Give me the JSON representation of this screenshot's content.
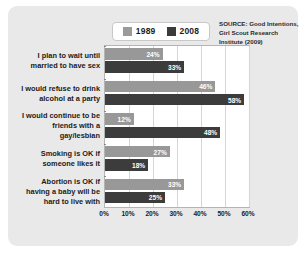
{
  "legend": {
    "entries": [
      {
        "label": "1989",
        "color": "#989898"
      },
      {
        "label": "2008",
        "color": "#3c3c3c"
      }
    ]
  },
  "source": {
    "line1": "SOURCE: Good Intentions,",
    "line2": "Girl Scout Research",
    "line3": "Institute (2009)"
  },
  "chart_data": {
    "type": "bar",
    "orientation": "horizontal",
    "title": "",
    "subtitle": "",
    "xlabel": "",
    "ylabel": "",
    "xlim": [
      0,
      60
    ],
    "grid": true,
    "legend_position": "top",
    "tick_labels": [
      "0%",
      "10%",
      "20%",
      "30%",
      "40%",
      "50%",
      "60%"
    ],
    "tick_values": [
      0,
      10,
      20,
      30,
      40,
      50,
      60
    ],
    "categories": [
      "I plan to wait until married to have sex",
      "I would refuse to drink alcohol at a party",
      "I would continue to be friends with a gay/lesbian",
      "Smoking is OK if someone likes it",
      "Abortion is OK if having a baby will be hard to live with"
    ],
    "category_lines": [
      [
        "I plan to wait until",
        "married to have sex"
      ],
      [
        "I would refuse to drink",
        "alcohol at a party"
      ],
      [
        "I would continue to be",
        "friends with a",
        "gay/lesbian"
      ],
      [
        "Smoking is OK if",
        "someone likes it"
      ],
      [
        "Abortion is OK if",
        "having a baby will be",
        "hard to live with"
      ]
    ],
    "series": [
      {
        "name": "1989",
        "color": "#989898",
        "values": [
          24,
          46,
          12,
          27,
          33
        ],
        "labels": [
          "24%",
          "46%",
          "12%",
          "27%",
          "33%"
        ]
      },
      {
        "name": "2008",
        "color": "#3c3c3c",
        "values": [
          33,
          58,
          48,
          18,
          25
        ],
        "labels": [
          "33%",
          "58%",
          "48%",
          "18%",
          "25%"
        ]
      }
    ]
  }
}
